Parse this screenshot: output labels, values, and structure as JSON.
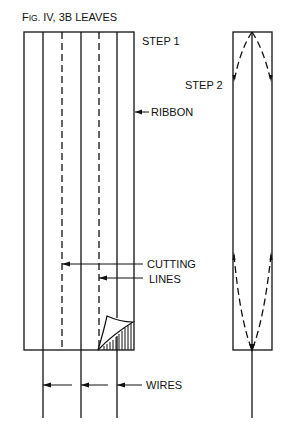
{
  "figure": {
    "title_prefix": "F",
    "title_small": "IG.",
    "title_rest": " IV, 3B LEAVES"
  },
  "labels": {
    "step1": "STEP 1",
    "step2": "STEP 2",
    "ribbon": "RIBBON",
    "cutting": "CUTTING",
    "lines": "LINES",
    "wires": "WIRES"
  },
  "colors": {
    "ink": "#111111",
    "background": "#ffffff"
  }
}
